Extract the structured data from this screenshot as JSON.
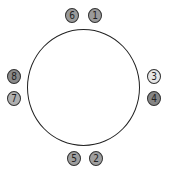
{
  "diagram": {
    "type": "seating-circle",
    "badges": [
      {
        "label": "6",
        "x": 65,
        "y": 8,
        "fill": "#9a9a9a"
      },
      {
        "label": "1",
        "x": 88,
        "y": 8,
        "fill": "#9a9a9a"
      },
      {
        "label": "8",
        "x": 7,
        "y": 69,
        "fill": "#8a8a8a"
      },
      {
        "label": "7",
        "x": 7,
        "y": 91,
        "fill": "#b0b0b0"
      },
      {
        "label": "3",
        "x": 147,
        "y": 69,
        "fill": "#e6e6e6"
      },
      {
        "label": "4",
        "x": 147,
        "y": 91,
        "fill": "#858585"
      },
      {
        "label": "5",
        "x": 67,
        "y": 151,
        "fill": "#9f9f9f"
      },
      {
        "label": "2",
        "x": 89,
        "y": 151,
        "fill": "#9f9f9f"
      }
    ]
  }
}
